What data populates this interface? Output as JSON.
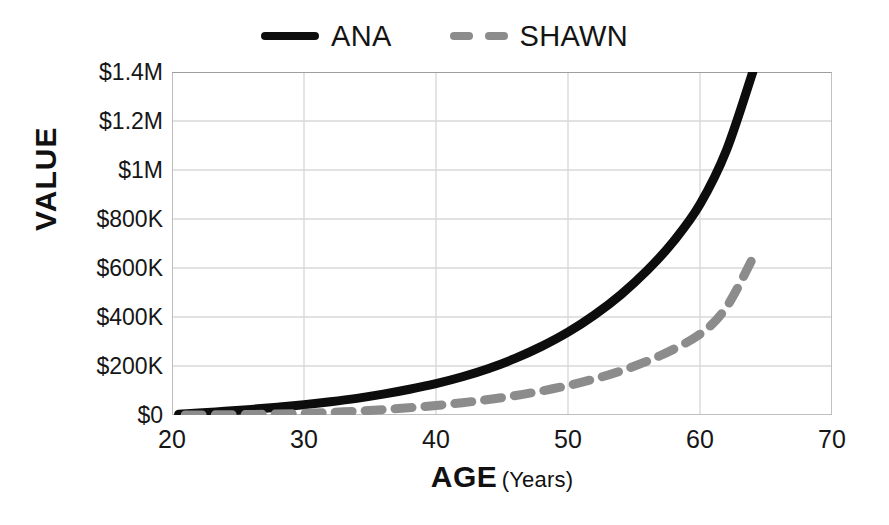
{
  "chart_data": {
    "type": "line",
    "title": "",
    "xlabel": "AGE",
    "xlabel_unit": "(Years)",
    "ylabel": "VALUE",
    "xlim": [
      20,
      70
    ],
    "ylim": [
      0,
      1400000
    ],
    "grid": true,
    "legend_position": "top-center",
    "x_tick_labels": [
      "20",
      "30",
      "40",
      "50",
      "60",
      "70"
    ],
    "x_tick_values": [
      20,
      30,
      40,
      50,
      60,
      70
    ],
    "y_tick_labels": [
      "$0",
      "$200K",
      "$400K",
      "$600K",
      "$800K",
      "$1M",
      "$1.2M",
      "$1.4M"
    ],
    "y_tick_values": [
      0,
      200000,
      400000,
      600000,
      800000,
      1000000,
      1200000,
      1400000
    ],
    "series": [
      {
        "name": "ANA",
        "style": "solid",
        "color": "#0d0d0d",
        "width": 9,
        "x": [
          20.5,
          22,
          24,
          26,
          28,
          30,
          32,
          34,
          36,
          38,
          40,
          42,
          44,
          46,
          48,
          50,
          52,
          54,
          56,
          58,
          60,
          62,
          64
        ],
        "values": [
          3000,
          8000,
          15000,
          23000,
          32000,
          42000,
          54000,
          68000,
          85000,
          105000,
          128000,
          156000,
          190000,
          231000,
          280000,
          338000,
          408000,
          491000,
          590000,
          709000,
          860000,
          1080000,
          1400000
        ]
      },
      {
        "name": "SHAWN",
        "style": "dashed",
        "color": "#8c8c8c",
        "width": 9,
        "x": [
          21,
          24,
          27,
          30,
          33,
          36,
          39,
          42,
          45,
          48,
          51,
          54,
          57,
          60,
          62,
          64
        ],
        "values": [
          0,
          1000,
          3000,
          7000,
          13000,
          22000,
          34000,
          50000,
          71000,
          98000,
          133000,
          180000,
          243000,
          330000,
          440000,
          640000
        ]
      }
    ]
  },
  "legend": {
    "entries": [
      {
        "label": "ANA",
        "style": "solid",
        "color": "#0d0d0d"
      },
      {
        "label": "SHAWN",
        "style": "dashed",
        "color": "#8c8c8c"
      }
    ]
  },
  "axes": {
    "y_title": "VALUE",
    "x_title_main": "AGE",
    "x_title_sub": "(Years)"
  },
  "colors": {
    "grid": "#d9d9d9",
    "axis": "#b3b3b3",
    "text": "#161616",
    "ana": "#0d0d0d",
    "shawn": "#8c8c8c"
  }
}
